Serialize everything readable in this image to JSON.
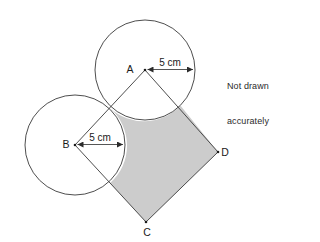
{
  "figure": {
    "note": "Not drawn\naccurately",
    "note_line1": "Not drawn",
    "note_line2": "accurately",
    "stroke_color": "#3a3a3a",
    "shade_color": "#cccccc",
    "background": "#ffffff",
    "points": [
      {
        "id": "A",
        "label": "A",
        "x": 145,
        "y": 70
      },
      {
        "id": "B",
        "label": "B",
        "x": 75,
        "y": 145
      },
      {
        "id": "C",
        "label": "C",
        "x": 146,
        "y": 222
      },
      {
        "id": "D",
        "label": "D",
        "x": 218,
        "y": 152
      }
    ],
    "circles": [
      {
        "id": "circle-a",
        "center": "A",
        "cx": 145,
        "cy": 70,
        "r": 50
      },
      {
        "id": "circle-b",
        "center": "B",
        "cx": 75,
        "cy": 145,
        "r": 50
      }
    ],
    "dimensions": [
      {
        "id": "radius-a",
        "label": "5 cm",
        "from": "A",
        "value": 5,
        "unit": "cm"
      },
      {
        "id": "radius-b",
        "label": "5 cm",
        "from": "B",
        "value": 5,
        "unit": "cm"
      }
    ],
    "labels": {
      "a": "A",
      "b": "B",
      "c": "C",
      "d": "D",
      "radius_a": "5 cm",
      "radius_b": "5 cm"
    }
  }
}
